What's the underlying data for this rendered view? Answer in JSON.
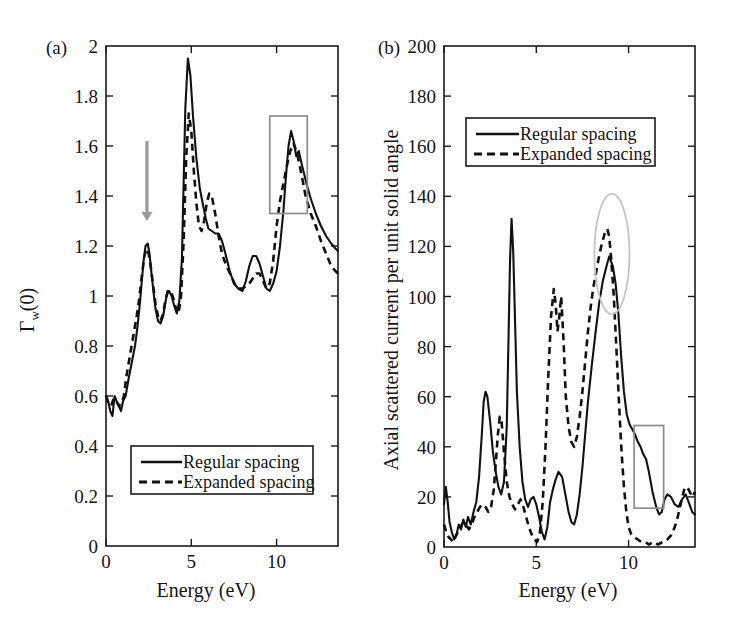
{
  "figure": {
    "background": "#ffffff",
    "line_color": "#111111",
    "annotation_color": "#8c8c8c",
    "ellipse_color": "#c4c4c4",
    "arrow_color": "#9a9a9a"
  },
  "panel_a": {
    "label": "(a)",
    "legend": {
      "items": [
        {
          "label": "Regular spacing",
          "style": "solid"
        },
        {
          "label": "Expanded spacing",
          "style": "dashed"
        }
      ]
    },
    "annotations": {
      "arrow": {
        "x": 2.4,
        "y_from": 1.62,
        "y_to": 1.3,
        "color": "#9a9a9a"
      },
      "box": {
        "x0": 9.6,
        "x1": 11.8,
        "y0": 1.33,
        "y1": 1.72,
        "color": "#8c8c8c"
      }
    }
  },
  "panel_b": {
    "label": "(b)",
    "legend": {
      "items": [
        {
          "label": "Regular spacing",
          "style": "solid"
        },
        {
          "label": "Expanded spacing",
          "style": "dashed"
        }
      ]
    },
    "annotations": {
      "ellipse": {
        "cx": 9.1,
        "cy": 117,
        "rx": 0.95,
        "ry": 24,
        "color": "#c4c4c4"
      },
      "box": {
        "x0": 10.3,
        "x1": 11.9,
        "y0": 15.5,
        "y1": 48.5,
        "color": "#8c8c8c"
      }
    }
  },
  "chart_data": [
    {
      "type": "line",
      "panel": "a",
      "title": "(a)",
      "xlabel": "Energy (eV)",
      "ylabel": "Γw(0)",
      "ylabel_display": "Γ",
      "ylabel_sub": "w",
      "ylabel_rest": "(0)",
      "xlim": [
        0,
        13.6
      ],
      "ylim": [
        0,
        2
      ],
      "xticks": [
        0,
        5,
        10
      ],
      "xticklabels": [
        "0",
        "5",
        "10"
      ],
      "xminorticks": [
        2.5,
        7.5,
        12.5
      ],
      "yticks": [
        0,
        0.2,
        0.4,
        0.6,
        0.8,
        1,
        1.2,
        1.4,
        1.6,
        1.8,
        2
      ],
      "yticklabels": [
        "0",
        "0.2",
        "0.4",
        "0.6",
        "0.8",
        "1",
        "1.2",
        "1.4",
        "1.6",
        "1.8",
        "2"
      ],
      "grid": false,
      "legend_position": "lower-left-inside",
      "series": [
        {
          "name": "Regular spacing",
          "style": "solid",
          "x": [
            0.0,
            0.12,
            0.25,
            0.38,
            0.5,
            0.62,
            0.75,
            0.88,
            1.0,
            1.15,
            1.3,
            1.5,
            1.7,
            1.85,
            2.0,
            2.1,
            2.2,
            2.32,
            2.45,
            2.55,
            2.65,
            2.78,
            2.9,
            3.05,
            3.2,
            3.35,
            3.5,
            3.6,
            3.7,
            3.85,
            4.0,
            4.15,
            4.3,
            4.45,
            4.55,
            4.65,
            4.8,
            4.95,
            5.1,
            5.3,
            5.5,
            5.7,
            5.85,
            6.0,
            6.2,
            6.4,
            6.6,
            6.8,
            7.0,
            7.25,
            7.5,
            7.75,
            8.0,
            8.2,
            8.4,
            8.6,
            8.8,
            9.0,
            9.2,
            9.4,
            9.6,
            9.8,
            10.0,
            10.2,
            10.4,
            10.55,
            10.7,
            10.85,
            11.0,
            11.15,
            11.3,
            11.5,
            11.75,
            12.0,
            12.3,
            12.6,
            12.9,
            13.2,
            13.45,
            13.6
          ],
          "y": [
            0.6,
            0.58,
            0.54,
            0.52,
            0.6,
            0.58,
            0.56,
            0.54,
            0.58,
            0.6,
            0.66,
            0.73,
            0.8,
            0.88,
            0.98,
            1.06,
            1.14,
            1.2,
            1.21,
            1.17,
            1.1,
            1.02,
            0.95,
            0.9,
            0.89,
            0.92,
            0.98,
            1.02,
            1.02,
            1.0,
            0.96,
            0.93,
            0.98,
            1.15,
            1.45,
            1.75,
            1.95,
            1.88,
            1.72,
            1.55,
            1.43,
            1.36,
            1.31,
            1.27,
            1.26,
            1.25,
            1.25,
            1.22,
            1.17,
            1.1,
            1.05,
            1.03,
            1.02,
            1.06,
            1.12,
            1.16,
            1.16,
            1.13,
            1.08,
            1.03,
            1.02,
            1.05,
            1.1,
            1.2,
            1.34,
            1.48,
            1.6,
            1.66,
            1.62,
            1.56,
            1.58,
            1.52,
            1.45,
            1.39,
            1.33,
            1.28,
            1.24,
            1.21,
            1.19,
            1.18
          ]
        },
        {
          "name": "Expanded spacing",
          "style": "dashed",
          "x": [
            0.0,
            0.15,
            0.3,
            0.45,
            0.6,
            0.75,
            0.9,
            1.05,
            1.2,
            1.4,
            1.6,
            1.8,
            1.95,
            2.1,
            2.25,
            2.38,
            2.5,
            2.62,
            2.75,
            2.9,
            3.05,
            3.2,
            3.35,
            3.5,
            3.65,
            3.8,
            3.95,
            4.1,
            4.25,
            4.4,
            4.55,
            4.7,
            4.85,
            5.0,
            5.15,
            5.3,
            5.45,
            5.6,
            5.75,
            5.9,
            6.05,
            6.2,
            6.4,
            6.6,
            6.8,
            7.0,
            7.2,
            7.4,
            7.6,
            7.8,
            8.0,
            8.2,
            8.4,
            8.6,
            8.8,
            9.0,
            9.2,
            9.4,
            9.6,
            9.8,
            10.0,
            10.2,
            10.4,
            10.6,
            10.8,
            11.0,
            11.2,
            11.45,
            11.7,
            12.0,
            12.3,
            12.6,
            12.9,
            13.2,
            13.45,
            13.6
          ],
          "y": [
            0.6,
            0.57,
            0.56,
            0.59,
            0.58,
            0.56,
            0.57,
            0.6,
            0.68,
            0.76,
            0.84,
            0.92,
            0.99,
            1.08,
            1.16,
            1.19,
            1.17,
            1.12,
            1.05,
            0.97,
            0.92,
            0.9,
            0.93,
            0.99,
            1.02,
            1.02,
            0.99,
            0.95,
            0.93,
            1.0,
            1.22,
            1.55,
            1.73,
            1.66,
            1.5,
            1.37,
            1.28,
            1.26,
            1.3,
            1.37,
            1.41,
            1.4,
            1.33,
            1.24,
            1.17,
            1.13,
            1.1,
            1.07,
            1.04,
            1.03,
            1.03,
            1.04,
            1.05,
            1.07,
            1.09,
            1.09,
            1.06,
            1.03,
            1.05,
            1.14,
            1.28,
            1.38,
            1.45,
            1.52,
            1.58,
            1.61,
            1.57,
            1.49,
            1.4,
            1.33,
            1.28,
            1.22,
            1.17,
            1.12,
            1.1,
            1.09
          ]
        }
      ]
    },
    {
      "type": "line",
      "panel": "b",
      "title": "(b)",
      "xlabel": "Energy (eV)",
      "ylabel": "Axial scattered current per unit solid angle",
      "xlim": [
        0,
        13.6
      ],
      "ylim": [
        0,
        200
      ],
      "xticks": [
        0,
        5,
        10
      ],
      "xticklabels": [
        "0",
        "5",
        "10"
      ],
      "xminorticks": [
        2.5,
        7.5,
        12.5
      ],
      "yticks": [
        0,
        20,
        40,
        60,
        80,
        100,
        120,
        140,
        160,
        180,
        200
      ],
      "yticklabels": [
        "0",
        "20",
        "40",
        "60",
        "80",
        "100",
        "120",
        "140",
        "160",
        "180",
        "200"
      ],
      "grid": false,
      "legend_position": "upper-left-inside",
      "series": [
        {
          "name": "Regular spacing",
          "style": "solid",
          "x": [
            0.0,
            0.1,
            0.2,
            0.3,
            0.42,
            0.55,
            0.68,
            0.8,
            0.92,
            1.05,
            1.18,
            1.3,
            1.45,
            1.6,
            1.75,
            1.9,
            2.05,
            2.15,
            2.25,
            2.35,
            2.5,
            2.65,
            2.8,
            2.95,
            3.1,
            3.25,
            3.4,
            3.5,
            3.58,
            3.66,
            3.75,
            3.85,
            3.95,
            4.1,
            4.25,
            4.4,
            4.55,
            4.7,
            4.85,
            5.0,
            5.15,
            5.3,
            5.45,
            5.6,
            5.75,
            5.9,
            6.05,
            6.2,
            6.4,
            6.6,
            6.75,
            6.9,
            7.05,
            7.2,
            7.35,
            7.5,
            7.65,
            7.8,
            8.0,
            8.2,
            8.4,
            8.6,
            8.8,
            8.95,
            9.05,
            9.15,
            9.3,
            9.45,
            9.6,
            9.75,
            9.9,
            10.05,
            10.2,
            10.35,
            10.5,
            10.65,
            10.8,
            10.95,
            11.1,
            11.3,
            11.5,
            11.65,
            11.8,
            11.95,
            12.1,
            12.3,
            12.5,
            12.7,
            12.9,
            13.1,
            13.3,
            13.45,
            13.6
          ],
          "y": [
            17,
            24,
            18,
            10,
            6,
            3,
            5,
            9,
            7,
            11,
            8,
            12,
            9,
            14,
            18,
            28,
            45,
            58,
            62,
            60,
            50,
            38,
            30,
            24,
            21,
            26,
            48,
            85,
            115,
            131,
            118,
            90,
            62,
            40,
            26,
            19,
            16,
            19,
            20,
            17,
            12,
            6,
            3,
            8,
            18,
            23,
            27,
            30,
            28,
            20,
            14,
            10,
            9,
            13,
            21,
            32,
            45,
            58,
            72,
            85,
            97,
            106,
            112,
            116,
            114,
            112,
            105,
            93,
            76,
            62,
            53,
            49,
            47,
            45,
            42,
            40,
            37,
            35,
            30,
            22,
            16,
            13,
            14,
            19,
            21,
            20,
            17,
            16,
            19,
            21,
            17,
            14,
            13
          ]
        },
        {
          "name": "Expanded spacing",
          "style": "dashed",
          "x": [
            0.0,
            0.12,
            0.25,
            0.38,
            0.5,
            0.62,
            0.75,
            0.9,
            1.05,
            1.2,
            1.35,
            1.5,
            1.65,
            1.8,
            1.95,
            2.1,
            2.25,
            2.4,
            2.55,
            2.7,
            2.82,
            2.92,
            3.02,
            3.12,
            3.25,
            3.4,
            3.55,
            3.7,
            3.85,
            4.0,
            4.15,
            4.3,
            4.45,
            4.6,
            4.75,
            4.9,
            5.05,
            5.2,
            5.35,
            5.5,
            5.65,
            5.8,
            5.95,
            6.05,
            6.15,
            6.25,
            6.35,
            6.48,
            6.6,
            6.75,
            6.9,
            7.05,
            7.2,
            7.35,
            7.5,
            7.65,
            7.8,
            7.95,
            8.1,
            8.25,
            8.4,
            8.55,
            8.7,
            8.85,
            8.95,
            9.05,
            9.2,
            9.35,
            9.5,
            9.62,
            9.75,
            9.88,
            10.0,
            10.15,
            10.3,
            10.5,
            10.7,
            10.9,
            11.1,
            11.35,
            11.6,
            11.85,
            12.1,
            12.35,
            12.6,
            12.85,
            13.05,
            13.25,
            13.45,
            13.6
          ],
          "y": [
            9,
            6,
            4,
            3,
            2,
            4,
            6,
            8,
            10,
            9,
            7,
            9,
            12,
            14,
            16,
            17,
            16,
            14,
            16,
            23,
            35,
            45,
            52,
            50,
            38,
            26,
            20,
            17,
            15,
            17,
            19,
            16,
            12,
            8,
            5,
            3,
            2,
            6,
            18,
            40,
            68,
            92,
            103,
            97,
            86,
            92,
            100,
            82,
            60,
            48,
            42,
            40,
            44,
            52,
            62,
            74,
            86,
            96,
            104,
            110,
            116,
            121,
            125,
            127,
            124,
            116,
            100,
            78,
            55,
            38,
            24,
            14,
            8,
            5,
            4,
            3,
            2,
            2,
            1,
            2,
            1,
            2,
            3,
            5,
            10,
            18,
            24,
            23,
            20,
            22
          ]
        }
      ]
    }
  ]
}
